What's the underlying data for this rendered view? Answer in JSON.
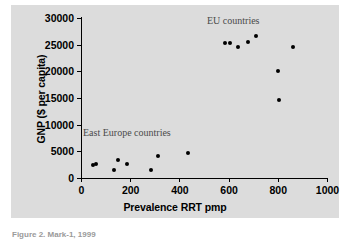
{
  "chart_data": {
    "type": "scatter",
    "title": "",
    "xlabel": "Prevalence RRT pmp",
    "ylabel": "GNP ($ per capita)",
    "xlim": [
      0,
      1000
    ],
    "ylim": [
      0,
      30000
    ],
    "xticks": [
      0,
      200,
      400,
      600,
      800,
      1000
    ],
    "yticks": [
      0,
      5000,
      10000,
      15000,
      20000,
      25000,
      30000
    ],
    "xtick_labels": [
      "0",
      "200",
      "400",
      "600",
      "800",
      "1000"
    ],
    "ytick_labels": [
      "0",
      "5000",
      "10000",
      "15000",
      "20000",
      "25000",
      "30000"
    ],
    "grid": false,
    "legend": "none",
    "annotations": [
      {
        "text": "EU countries",
        "x": 620,
        "y": 29000
      },
      {
        "text": "East Europe countries",
        "x": 55,
        "y": 8500
      }
    ],
    "series": [
      {
        "name": "countries",
        "marker": "filled-circle",
        "color": "#000000",
        "points": [
          {
            "x": 50,
            "y": 2350
          },
          {
            "x": 62,
            "y": 2650
          },
          {
            "x": 135,
            "y": 1550
          },
          {
            "x": 152,
            "y": 3450
          },
          {
            "x": 188,
            "y": 2650
          },
          {
            "x": 285,
            "y": 1500
          },
          {
            "x": 315,
            "y": 4150
          },
          {
            "x": 435,
            "y": 4700
          },
          {
            "x": 585,
            "y": 25300
          },
          {
            "x": 605,
            "y": 25300
          },
          {
            "x": 640,
            "y": 24550
          },
          {
            "x": 680,
            "y": 25550
          },
          {
            "x": 710,
            "y": 26600
          },
          {
            "x": 800,
            "y": 20050
          },
          {
            "x": 805,
            "y": 14700
          },
          {
            "x": 860,
            "y": 24500
          }
        ]
      }
    ]
  },
  "caption": {
    "text": "Figure 2.  Mark-1, 1999"
  }
}
